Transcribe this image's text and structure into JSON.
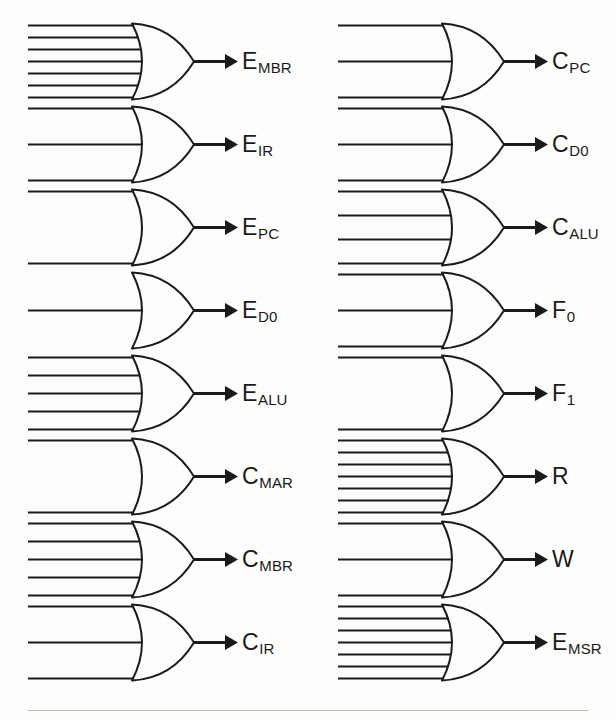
{
  "figure": {
    "type": "logic-gate-diagram",
    "gate_type": "OR",
    "columns": 2,
    "rows_per_column": 8,
    "total_gates": 16,
    "line_color": "#1a1a1a",
    "background_color": "#fdfdfb"
  },
  "gates": [
    {
      "id": "g1",
      "column": 0,
      "row": 0,
      "inputs": 7,
      "output_main": "E",
      "output_sub": "MBR"
    },
    {
      "id": "g2",
      "column": 0,
      "row": 1,
      "inputs": 3,
      "output_main": "E",
      "output_sub": "IR"
    },
    {
      "id": "g3",
      "column": 0,
      "row": 2,
      "inputs": 2,
      "output_main": "E",
      "output_sub": "PC"
    },
    {
      "id": "g4",
      "column": 0,
      "row": 3,
      "inputs": 1,
      "output_main": "E",
      "output_sub": "D0"
    },
    {
      "id": "g5",
      "column": 0,
      "row": 4,
      "inputs": 5,
      "output_main": "E",
      "output_sub": "ALU"
    },
    {
      "id": "g6",
      "column": 0,
      "row": 5,
      "inputs": 2,
      "output_main": "C",
      "output_sub": "MAR"
    },
    {
      "id": "g7",
      "column": 0,
      "row": 6,
      "inputs": 5,
      "output_main": "C",
      "output_sub": "MBR"
    },
    {
      "id": "g8",
      "column": 0,
      "row": 7,
      "inputs": 3,
      "output_main": "C",
      "output_sub": "IR"
    },
    {
      "id": "g9",
      "column": 1,
      "row": 0,
      "inputs": 3,
      "output_main": "C",
      "output_sub": "PC"
    },
    {
      "id": "g10",
      "column": 1,
      "row": 1,
      "inputs": 3,
      "output_main": "C",
      "output_sub": "D0"
    },
    {
      "id": "g11",
      "column": 1,
      "row": 2,
      "inputs": 4,
      "output_main": "C",
      "output_sub": "ALU"
    },
    {
      "id": "g12",
      "column": 1,
      "row": 3,
      "inputs": 3,
      "output_main": "F",
      "output_sub": "0"
    },
    {
      "id": "g13",
      "column": 1,
      "row": 4,
      "inputs": 2,
      "output_main": "F",
      "output_sub": "1"
    },
    {
      "id": "g14",
      "column": 1,
      "row": 5,
      "inputs": 7,
      "output_main": "R",
      "output_sub": ""
    },
    {
      "id": "g15",
      "column": 1,
      "row": 6,
      "inputs": 3,
      "output_main": "W",
      "output_sub": ""
    },
    {
      "id": "g16",
      "column": 1,
      "row": 7,
      "inputs": 7,
      "output_main": "E",
      "output_sub": "MSR"
    }
  ],
  "geometry": {
    "column_x": [
      28,
      338
    ],
    "row_y": [
      20,
      103,
      186,
      269,
      352,
      435,
      518,
      601
    ],
    "cell_width": 262,
    "cell_height": 83,
    "gate_body_left": 104,
    "gate_body_width": 62,
    "gate_half_height": 38,
    "arrow_tip_x": 210,
    "label_x": 214
  }
}
